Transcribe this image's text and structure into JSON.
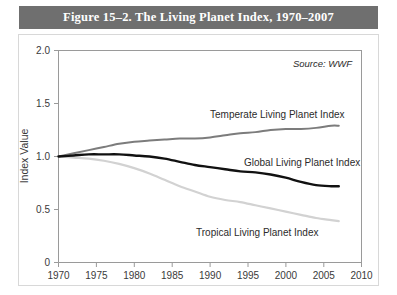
{
  "figure": {
    "title": "Figure 15–2. The Living Planet Index, 1970–2007",
    "source_note": "Source: WWF"
  },
  "axis": {
    "y_title": "Index Value",
    "y_ticks": [
      "0",
      "0.5",
      "1.0",
      "1.5",
      "2.0"
    ],
    "x_ticks": [
      "1970",
      "1975",
      "1980",
      "1985",
      "1990",
      "1995",
      "2000",
      "2005",
      "2010"
    ]
  },
  "series_labels": {
    "temperate": "Temperate Living Planet Index",
    "global": "Global Living Planet Index",
    "tropical": "Tropical Living Planet Index"
  },
  "colors": {
    "title_bar": "#6f6f6f",
    "temperate": "#7c7c7c",
    "global": "#111111",
    "tropical": "#d2d2d2",
    "axis": "#9a9a9a",
    "frame": "#d8d8d8"
  },
  "chart_data": {
    "type": "line",
    "title": "Figure 15–2. The Living Planet Index, 1970–2007",
    "xlabel": "",
    "ylabel": "Index Value",
    "xlim": [
      1970,
      2010
    ],
    "ylim": [
      0,
      2.0
    ],
    "yticks": [
      0,
      0.5,
      1.0,
      1.5,
      2.0
    ],
    "xticks": [
      1970,
      1975,
      1980,
      1985,
      1990,
      1995,
      2000,
      2005,
      2010
    ],
    "grid": false,
    "legend": "inline-annotations",
    "annotations": [
      {
        "text": "Source: WWF",
        "x": 2005,
        "y": 1.84
      },
      {
        "text": "Temperate Living Planet Index",
        "x": 1995,
        "y": 1.3
      },
      {
        "text": "Global Living Planet Index",
        "x": 2000,
        "y": 0.94
      },
      {
        "text": "Tropical Living Planet Index",
        "x": 1995,
        "y": 0.3
      }
    ],
    "x": [
      1970,
      1972,
      1974,
      1976,
      1978,
      1980,
      1982,
      1984,
      1986,
      1988,
      1990,
      1992,
      1994,
      1996,
      1998,
      2000,
      2002,
      2004,
      2006,
      2007
    ],
    "series": [
      {
        "name": "Temperate Living Planet Index",
        "color": "#7c7c7c",
        "values": [
          1.0,
          1.03,
          1.06,
          1.09,
          1.12,
          1.14,
          1.15,
          1.16,
          1.17,
          1.17,
          1.18,
          1.2,
          1.22,
          1.23,
          1.25,
          1.26,
          1.26,
          1.27,
          1.29,
          1.29
        ]
      },
      {
        "name": "Global Living Planet Index",
        "color": "#111111",
        "values": [
          1.0,
          1.01,
          1.02,
          1.02,
          1.02,
          1.01,
          1.0,
          0.98,
          0.95,
          0.92,
          0.9,
          0.88,
          0.86,
          0.85,
          0.83,
          0.8,
          0.76,
          0.73,
          0.72,
          0.72
        ]
      },
      {
        "name": "Tropical Living Planet Index",
        "color": "#d2d2d2",
        "values": [
          1.0,
          0.99,
          0.98,
          0.96,
          0.93,
          0.89,
          0.84,
          0.78,
          0.72,
          0.67,
          0.62,
          0.59,
          0.57,
          0.54,
          0.51,
          0.48,
          0.45,
          0.42,
          0.4,
          0.39
        ]
      }
    ]
  }
}
